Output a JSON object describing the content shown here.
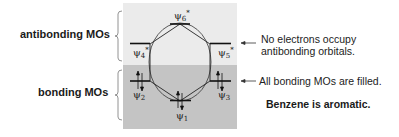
{
  "left_labels": {
    "antibonding": "antibonding MOs",
    "bonding": "bonding MOs"
  },
  "panel": {
    "antibonding_bg": "#ebebeb",
    "bonding_bg": "#c4c4c4"
  },
  "orbitals": [
    {
      "name": "ψ6",
      "star": "*",
      "level": "antibonding",
      "electrons": 0
    },
    {
      "name": "ψ4",
      "star": "*",
      "level": "antibonding",
      "electrons": 0
    },
    {
      "name": "ψ5",
      "star": "*",
      "level": "antibonding",
      "electrons": 0
    },
    {
      "name": "ψ2",
      "star": "",
      "level": "bonding",
      "electrons": 2
    },
    {
      "name": "ψ3",
      "star": "",
      "level": "bonding",
      "electrons": 2
    },
    {
      "name": "ψ1",
      "star": "",
      "level": "bonding",
      "electrons": 2
    }
  ],
  "psi_labels": {
    "psi6": "ψ",
    "psi6_sub": "6",
    "psi6_star": "*",
    "psi4": "ψ",
    "psi4_sub": "4",
    "psi4_star": "*",
    "psi5": "ψ",
    "psi5_sub": "5",
    "psi5_star": "*",
    "psi2": "ψ",
    "psi2_sub": "2",
    "psi3": "ψ",
    "psi3_sub": "3",
    "psi1": "ψ",
    "psi1_sub": "1"
  },
  "annotations": {
    "antibonding_line1": "No electrons occupy",
    "antibonding_line2": "antibonding orbitals.",
    "bonding": "All bonding MOs are filled.",
    "conclusion": "Benzene is aromatic."
  }
}
